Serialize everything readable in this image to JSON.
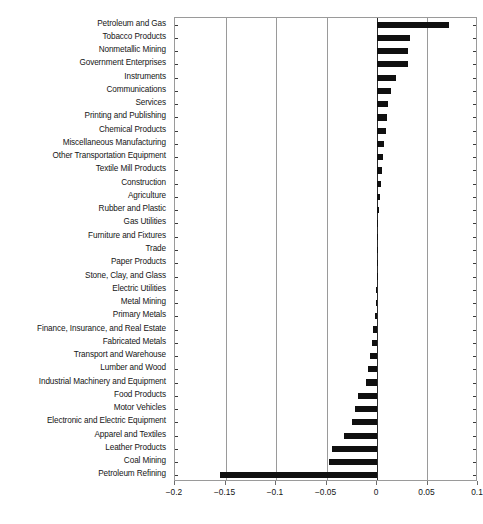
{
  "chart_data": {
    "type": "bar",
    "orientation": "horizontal",
    "title": "",
    "subtitle": "",
    "xlabel": "",
    "ylabel": "",
    "xlim": [
      -0.2,
      0.1
    ],
    "ylim": null,
    "grid": true,
    "gridlines_axis": "x",
    "legend": null,
    "legend_position": "none",
    "bar_color": "#101010",
    "zero_reference_line": 0,
    "xticks": [
      -0.2,
      -0.15,
      -0.1,
      -0.05,
      0,
      0.05,
      0.1
    ],
    "xtick_labels": [
      "−0.2",
      "−0.15",
      "−0.1",
      "−0.05",
      "0",
      "0.05",
      "0.1"
    ],
    "categories": [
      "Petroleum and Gas",
      "Tobacco Products",
      "Nonmetallic Mining",
      "Government Enterprises",
      "Instruments",
      "Communications",
      "Services",
      "Printing and Publishing",
      "Chemical Products",
      "Miscellaneous Manufacturing",
      "Other Transportation Equipment",
      "Textile Mill Products",
      "Construction",
      "Agriculture",
      "Rubber and Plastic",
      "Gas Utilities",
      "Furniture and Fixtures",
      "Trade",
      "Paper Products",
      "Stone, Clay, and Glass",
      "Electric Utilities",
      "Metal Mining",
      "Primary Metals",
      "Finance, Insurance, and Real Estate",
      "Fabricated Metals",
      "Transport and Warehouse",
      "Lumber and Wood",
      "Industrial Machinery and Equipment",
      "Food Products",
      "Motor Vehicles",
      "Electronic and Electric Equipment",
      "Apparel and Textiles",
      "Leather Products",
      "Coal Mining",
      "Petroleum Refining"
    ],
    "values": [
      0.0715,
      0.0325,
      0.0305,
      0.0305,
      0.0185,
      0.0135,
      0.0105,
      0.01,
      0.0085,
      0.007,
      0.0058,
      0.0048,
      0.0038,
      0.003,
      0.0022,
      0.0012,
      0.0008,
      0.0005,
      0.0002,
      -0.0002,
      -0.0005,
      -0.0012,
      -0.0022,
      -0.004,
      -0.0052,
      -0.0068,
      -0.0085,
      -0.0105,
      -0.0185,
      -0.0215,
      -0.025,
      -0.033,
      -0.0445,
      -0.0475,
      -0.1555
    ]
  }
}
